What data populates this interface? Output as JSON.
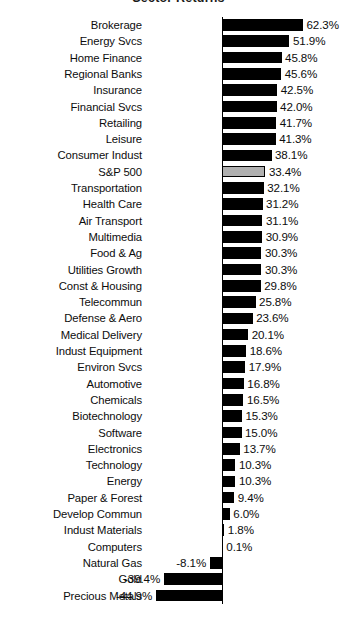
{
  "chart_data": {
    "type": "bar",
    "orientation": "horizontal",
    "title": "Sector Returns",
    "xlabel": "",
    "ylabel": "",
    "value_suffix": "%",
    "grid": false,
    "legend": null,
    "axis_zero_label": "0",
    "xlim": [
      -50,
      70
    ],
    "highlight_category": "S&P 500",
    "highlight_color": "#b0b0b0",
    "bar_color": "#000000",
    "categories": [
      "Brokerage",
      "Energy Svcs",
      "Home Finance",
      "Regional Banks",
      "Insurance",
      "Financial Svcs",
      "Retailing",
      "Leisure",
      "Consumer Indust",
      "S&P 500",
      "Transportation",
      "Health Care",
      "Air Transport",
      "Multimedia",
      "Food & Ag",
      "Utilities Growth",
      "Const  & Housing",
      "Telecommun",
      "Defense & Aero",
      "Medical Delivery",
      "Indust Equipment",
      "Environ Svcs",
      "Automotive",
      "Chemicals",
      "Biotechnology",
      "Software",
      "Electronics",
      "Technology",
      "Energy",
      "Paper & Forest",
      "Develop Commun",
      "Indust Materials",
      "Computers",
      "Natural Gas",
      "Gold",
      "Precious Metals"
    ],
    "values": [
      62.3,
      51.9,
      45.8,
      45.6,
      42.5,
      42.0,
      41.7,
      41.3,
      38.1,
      33.4,
      32.1,
      31.2,
      31.1,
      30.9,
      30.3,
      30.3,
      29.8,
      25.8,
      23.6,
      20.1,
      18.6,
      17.9,
      16.8,
      16.5,
      15.3,
      15.0,
      13.7,
      10.3,
      10.3,
      9.4,
      6.0,
      1.8,
      0.1,
      -8.1,
      -39.4,
      -44.9
    ],
    "value_labels": [
      "62.3%",
      "51.9%",
      "45.8%",
      "45.6%",
      "42.5%",
      "42.0%",
      "41.7%",
      "41.3%",
      "38.1%",
      "33.4%",
      "32.1%",
      "31.2%",
      "31.1%",
      "30.9%",
      "30.3%",
      "30.3%",
      "29.8%",
      "25.8%",
      "23.6%",
      "20.1%",
      "18.6%",
      "17.9%",
      "16.8%",
      "16.5%",
      "15.3%",
      "15.0%",
      "13.7%",
      "10.3%",
      "10.3%",
      "9.4%",
      "6.0%",
      "1.8%",
      "0.1%",
      "-8.1%",
      "-39.4%",
      "-44.9%"
    ]
  }
}
